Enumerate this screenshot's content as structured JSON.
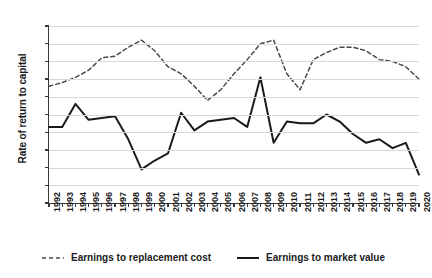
{
  "chart_data": {
    "type": "line",
    "title": "",
    "xlabel": "",
    "ylabel": "Rate of return to capital",
    "ylim": [
      2.0,
      12.0
    ],
    "ytick_labels": [
      "12.0",
      "11.0",
      "10.0",
      "9.0",
      "8.0",
      "7.0",
      "6.0",
      "5.0",
      "4.0",
      "3.0",
      "2.0"
    ],
    "ytick_values": [
      12.0,
      11.0,
      10.0,
      9.0,
      8.0,
      7.0,
      6.0,
      5.0,
      4.0,
      3.0,
      2.0
    ],
    "grid": true,
    "legend_position": "bottom",
    "categories": [
      "1992",
      "1993",
      "1994",
      "1995",
      "1996",
      "1997",
      "1998",
      "1999",
      "2000",
      "2001",
      "2002",
      "2003",
      "2004",
      "2005",
      "2006",
      "2007",
      "2008",
      "2009",
      "2010",
      "2011",
      "2012",
      "2013",
      "2014",
      "2015",
      "2016",
      "2017",
      "2018",
      "2019",
      "2020"
    ],
    "series": [
      {
        "name": "Earnings to replacement cost",
        "style": "dashed",
        "color": "#4a4a4a",
        "values": [
          8.6,
          8.8,
          9.1,
          9.5,
          10.2,
          10.3,
          10.8,
          11.2,
          10.6,
          9.7,
          9.3,
          8.6,
          7.8,
          8.4,
          9.3,
          10.1,
          11.0,
          11.2,
          9.3,
          8.4,
          10.1,
          10.5,
          10.8,
          10.8,
          10.6,
          10.1,
          10.0,
          9.7,
          9.0
        ]
      },
      {
        "name": "Earnings to market value",
        "style": "solid",
        "color": "#1a1a1a",
        "values": [
          6.3,
          6.3,
          7.6,
          6.7,
          6.8,
          6.9,
          5.6,
          3.9,
          4.4,
          4.8,
          7.1,
          6.1,
          6.6,
          6.7,
          6.8,
          6.3,
          9.1,
          5.4,
          6.6,
          6.5,
          6.5,
          7.0,
          6.6,
          5.9,
          5.4,
          5.6,
          5.1,
          5.4,
          3.6
        ]
      }
    ]
  },
  "legend": {
    "items": [
      {
        "label": "Earnings to replacement cost",
        "swatch": "dashed-line-swatch"
      },
      {
        "label": "Earnings to market value",
        "swatch": "solid-line-swatch"
      }
    ]
  }
}
